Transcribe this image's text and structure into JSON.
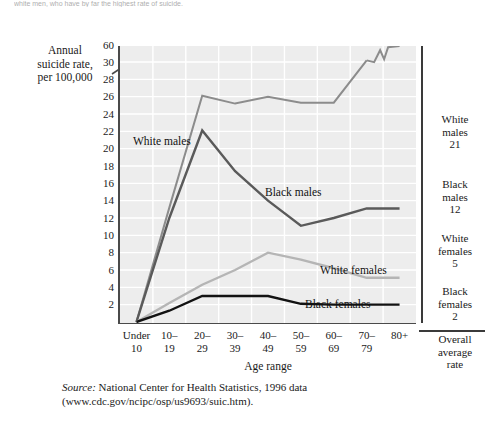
{
  "page": {
    "cutoff_text": "white men, who have by far the highest rate of suicide."
  },
  "chart_data": {
    "type": "line",
    "title": "",
    "xlabel": "Age range",
    "ylabel": "Annual suicide rate, per 100,000",
    "categories": [
      "Under 10",
      "10-19",
      "20-29",
      "30-39",
      "40-49",
      "50-59",
      "60-69",
      "70-79",
      "80+"
    ],
    "xtick_lines": [
      [
        "Under",
        "10"
      ],
      [
        "10–",
        "19"
      ],
      [
        "20–",
        "29"
      ],
      [
        "30–",
        "39"
      ],
      [
        "40–",
        "49"
      ],
      [
        "50–",
        "59"
      ],
      [
        "60–",
        "69"
      ],
      [
        "70–",
        "79"
      ],
      [
        "80+",
        ""
      ]
    ],
    "yticks": [
      2,
      4,
      6,
      8,
      10,
      12,
      14,
      16,
      18,
      20,
      22,
      24,
      26,
      28,
      30
    ],
    "ytick_top": 60,
    "ylim": [
      0,
      30
    ],
    "y_axis_break": true,
    "grid": true,
    "legend_position": "inline-right",
    "series": [
      {
        "name": "White males",
        "color": "#8c8c8c",
        "width": 2.0,
        "values": [
          0,
          13.2,
          26.1,
          25.2,
          26.0,
          25.3,
          25.3,
          33.0,
          60.0
        ],
        "has_break_segment": true,
        "overall_average_rate": 21
      },
      {
        "name": "Black males",
        "color": "#5a5a5a",
        "width": 2.4,
        "values": [
          0,
          12.0,
          22.1,
          17.4,
          14.0,
          11.1,
          12.0,
          13.1,
          13.1
        ],
        "overall_average_rate": 12
      },
      {
        "name": "White females",
        "color": "#b5b5b5",
        "width": 2.4,
        "values": [
          0,
          2.2,
          4.3,
          6.0,
          8.0,
          7.2,
          6.2,
          5.1,
          5.1
        ],
        "overall_average_rate": 5
      },
      {
        "name": "Black females",
        "color": "#121212",
        "width": 2.4,
        "values": [
          0,
          1.3,
          3.0,
          3.0,
          3.0,
          2.1,
          2.0,
          2.0,
          2.0
        ],
        "overall_average_rate": 2
      }
    ],
    "annotations": [
      {
        "text": "White males",
        "x_px": 133,
        "y_px": 135
      },
      {
        "text": "Black males",
        "x_px": 265,
        "y_px": 186
      },
      {
        "text": "White females",
        "x_px": 320,
        "y_px": 264
      },
      {
        "text": "Black females",
        "x_px": 305,
        "y_px": 298
      }
    ]
  },
  "legend_panel": {
    "items": [
      {
        "name_line1": "White",
        "name_line2": "males",
        "value": "21"
      },
      {
        "name_line1": "Black",
        "name_line2": "males",
        "value": "12"
      },
      {
        "name_line1": "White",
        "name_line2": "females",
        "value": "5"
      },
      {
        "name_line1": "Black",
        "name_line2": "females",
        "value": "2"
      }
    ],
    "footer_line1": "Overall",
    "footer_line2": "average",
    "footer_line3": "rate"
  },
  "source": {
    "label": "Source:",
    "text": " National Center for Health Statistics, 1996 data",
    "url_line": "(www.cdc.gov/ncipc/osp/us9693/suic.htm)."
  }
}
